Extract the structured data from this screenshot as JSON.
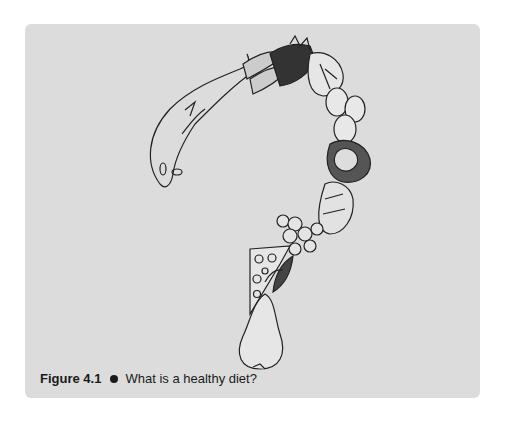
{
  "figure": {
    "label": "Figure 4.1",
    "bullet": "●",
    "caption": "What is a healthy diet?",
    "illustration": {
      "description": "Question mark composed of foods: fish, carrots, leafy greens, lettuce, eggs, cauliflower/vegetables, bread, berries/grapes, cheese wedge, herb leaves, pear",
      "background_color": "#dcdcdc"
    }
  }
}
